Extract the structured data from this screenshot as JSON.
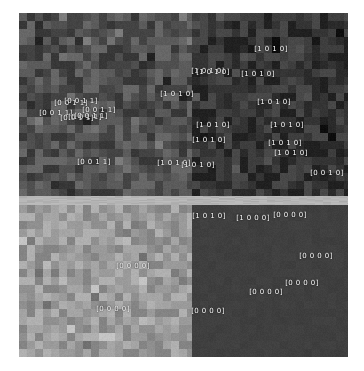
{
  "figure": {
    "background_color": "#ffffff",
    "plot": {
      "left": 19,
      "top": 13,
      "width": 329,
      "height": 344
    }
  },
  "chart_data": {
    "type": "heatmap",
    "title": "",
    "subtitle": "",
    "xlabel": "",
    "ylabel": "",
    "grid": false,
    "legend": "none",
    "cell_size": 8,
    "columns": 41,
    "rows": 43,
    "quadrant_split": {
      "x": 173,
      "y": 183
    },
    "boundary_band": {
      "y": 183,
      "height": 9,
      "color": "#b4b4b4"
    },
    "quadrants": [
      {
        "name": "top-left",
        "code": "[0 0 1 1]",
        "base_color": "#4f4f4f",
        "noise": 26,
        "texture": "checker",
        "x": 0,
        "y": 0,
        "width": 173,
        "height": 183
      },
      {
        "name": "top-right",
        "code": "[1 0 1 0]",
        "base_color": "#343434",
        "noise": 22,
        "texture": "checker",
        "x": 173,
        "y": 0,
        "width": 156,
        "height": 183
      },
      {
        "name": "bottom-left",
        "code": "[0 0 0 0]",
        "base_color": "#9a9a9a",
        "noise": 24,
        "texture": "checker",
        "x": 0,
        "y": 192,
        "width": 173,
        "height": 152
      },
      {
        "name": "bottom-right",
        "code": "[0 0 0 0]",
        "base_color": "#3f3f3f",
        "noise": 5,
        "texture": "flat",
        "x": 173,
        "y": 192,
        "width": 156,
        "height": 152
      }
    ],
    "label_color": "#ffffff",
    "labels": [
      {
        "text": "[0 0 1 1]",
        "x": 52,
        "y": 90
      },
      {
        "text": "[0 0 1 1]",
        "x": 62,
        "y": 88
      },
      {
        "text": "[0 0 1 1]",
        "x": 80,
        "y": 97
      },
      {
        "text": "[0 0 1 1]",
        "x": 37,
        "y": 100
      },
      {
        "text": "[0 0 1 1]",
        "x": 58,
        "y": 105
      },
      {
        "text": "[0 0 1 1]",
        "x": 66,
        "y": 104
      },
      {
        "text": "[0 0 1 1]",
        "x": 72,
        "y": 103
      },
      {
        "text": "[0 0 1 1]",
        "x": 75,
        "y": 149
      },
      {
        "text": "[1 0 1 0]",
        "x": 252,
        "y": 36
      },
      {
        "text": "[1 0 1 0]",
        "x": 189,
        "y": 58
      },
      {
        "text": "[1 0 1 0]",
        "x": 194,
        "y": 59
      },
      {
        "text": "[1 0 1 0]",
        "x": 239,
        "y": 61
      },
      {
        "text": "[1 0 1 0]",
        "x": 158,
        "y": 81
      },
      {
        "text": "[1 0 1 0]",
        "x": 255,
        "y": 89
      },
      {
        "text": "[1 0 1 0]",
        "x": 194,
        "y": 112
      },
      {
        "text": "[1 0 1 0]",
        "x": 268,
        "y": 112
      },
      {
        "text": "[1 0 1 0]",
        "x": 190,
        "y": 127
      },
      {
        "text": "[1 0 1 0]",
        "x": 266,
        "y": 130
      },
      {
        "text": "[1 0 1 0]",
        "x": 272,
        "y": 140
      },
      {
        "text": "[1 0 1 0]",
        "x": 155,
        "y": 150
      },
      {
        "text": "[1 0 1 0]",
        "x": 179,
        "y": 152
      },
      {
        "text": "[0 0 1 0]",
        "x": 308,
        "y": 160
      },
      {
        "text": "[0 0 0 0]",
        "x": 114,
        "y": 253
      },
      {
        "text": "[0 0 0 0]",
        "x": 94,
        "y": 296
      },
      {
        "text": "[1 0 1 0]",
        "x": 190,
        "y": 203
      },
      {
        "text": "[1 0 0 0]",
        "x": 234,
        "y": 205
      },
      {
        "text": "[0 0 0 0]",
        "x": 271,
        "y": 202
      },
      {
        "text": "[0 0 0 0]",
        "x": 297,
        "y": 243
      },
      {
        "text": "[0 0 0 0]",
        "x": 283,
        "y": 270
      },
      {
        "text": "[0 0 0 0]",
        "x": 247,
        "y": 279
      },
      {
        "text": "[0 0 0 0]",
        "x": 189,
        "y": 298
      }
    ]
  }
}
